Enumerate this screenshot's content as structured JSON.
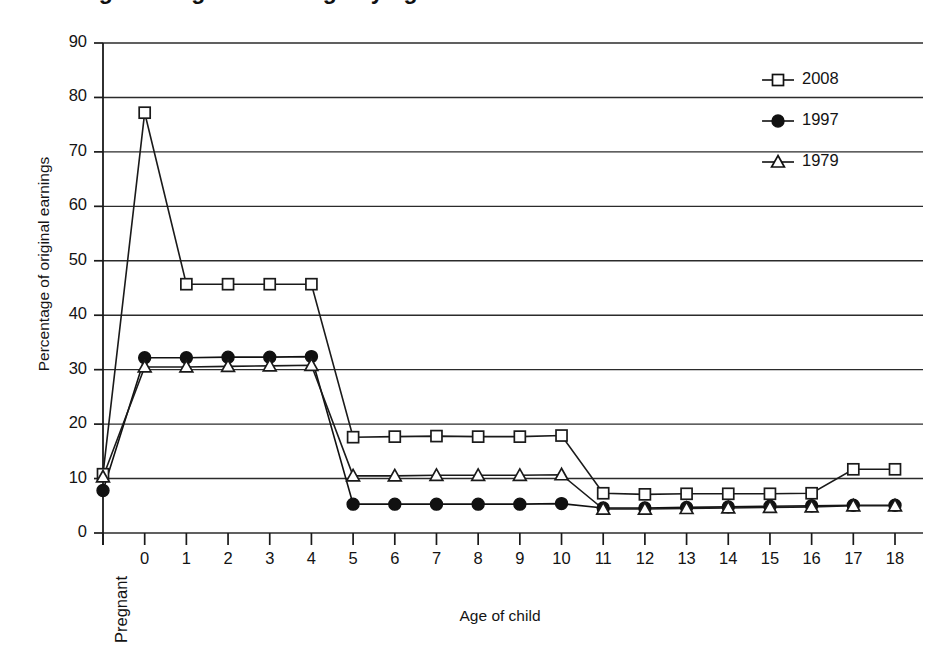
{
  "figure": {
    "title": "Percentage of original earnings by age of child",
    "title_clipped": true,
    "width": 931,
    "height": 652
  },
  "chart_data": {
    "type": "line",
    "title": "Percentage of original earnings by age of child",
    "xlabel": "Age of child",
    "ylabel": "Percentage of original earnings",
    "categories": [
      "Pregnant",
      "0",
      "1",
      "2",
      "3",
      "4",
      "5",
      "6",
      "7",
      "8",
      "9",
      "10",
      "11",
      "12",
      "13",
      "14",
      "15",
      "16",
      "17",
      "18"
    ],
    "ylim": [
      0,
      90
    ],
    "yticks": [
      0,
      10,
      20,
      30,
      40,
      50,
      60,
      70,
      80,
      90
    ],
    "grid": "horizontal",
    "legend_position": "top-right",
    "series": [
      {
        "name": "2008",
        "marker": "open-square",
        "color": "#1a1a1a",
        "values": [
          10.8,
          77.2,
          45.7,
          45.7,
          45.7,
          45.7,
          17.6,
          17.7,
          17.8,
          17.7,
          17.7,
          17.9,
          7.3,
          7.1,
          7.2,
          7.2,
          7.2,
          7.3,
          11.7,
          11.7
        ]
      },
      {
        "name": "1997",
        "marker": "filled-circle",
        "color": "#111111",
        "values": [
          7.8,
          32.2,
          32.2,
          32.3,
          32.3,
          32.4,
          5.3,
          5.3,
          5.3,
          5.3,
          5.3,
          5.4,
          4.6,
          4.6,
          4.7,
          4.8,
          4.9,
          5.0,
          5.1,
          5.1
        ]
      },
      {
        "name": "1979",
        "marker": "open-triangle",
        "color": "#1a1a1a",
        "values": [
          10.3,
          30.5,
          30.5,
          30.6,
          30.7,
          30.8,
          10.5,
          10.5,
          10.6,
          10.6,
          10.6,
          10.7,
          4.4,
          4.4,
          4.5,
          4.6,
          4.7,
          4.8,
          5.0,
          5.0
        ]
      }
    ]
  },
  "legend": {
    "entries": [
      {
        "label": "2008",
        "marker": "open-square"
      },
      {
        "label": "1997",
        "marker": "filled-circle"
      },
      {
        "label": "1979",
        "marker": "open-triangle"
      }
    ]
  },
  "colors": {
    "axis": "#1a1a1a",
    "grid": "#2b2b2b",
    "background": "#ffffff",
    "ink": "#111111"
  }
}
